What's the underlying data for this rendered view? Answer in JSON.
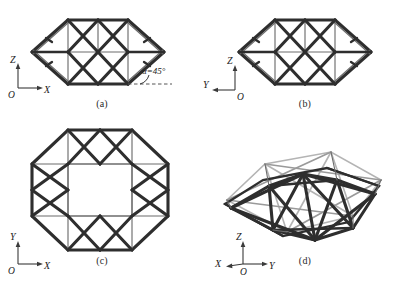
{
  "figure": {
    "kind": "four-view engineering line drawing of a deployable lenticular truss module",
    "background_color": "#ffffff",
    "line_color": "#2e2e2e",
    "panels": [
      {
        "id": "a",
        "caption": "(a)",
        "view": "front elevation",
        "axes": {
          "vertical": "Z",
          "horizontal": "X",
          "origin": "O",
          "horizontal_direction": "right"
        },
        "annotation": {
          "alpha_label": "α=45°",
          "has_arc": true,
          "has_dashed_reference": true
        }
      },
      {
        "id": "b",
        "caption": "(b)",
        "view": "side elevation",
        "axes": {
          "vertical": "Z",
          "horizontal": "Y",
          "origin": "O",
          "horizontal_direction": "left"
        },
        "annotation": {
          "alpha_label": "",
          "has_arc": false,
          "has_dashed_reference": false
        }
      },
      {
        "id": "c",
        "caption": "(c)",
        "view": "top plan",
        "axes": {
          "vertical": "Y",
          "horizontal": "X",
          "origin": "O",
          "horizontal_direction": "right"
        },
        "annotation": {
          "alpha_label": "",
          "has_arc": false,
          "has_dashed_reference": false
        }
      },
      {
        "id": "d",
        "caption": "(d)",
        "view": "isometric",
        "axes": {
          "vertical": "Z",
          "horizontal": "Y",
          "third": "X",
          "origin": "O",
          "horizontal_direction": "right"
        },
        "annotation": {
          "alpha_label": "",
          "has_arc": false,
          "has_dashed_reference": false
        }
      }
    ]
  }
}
